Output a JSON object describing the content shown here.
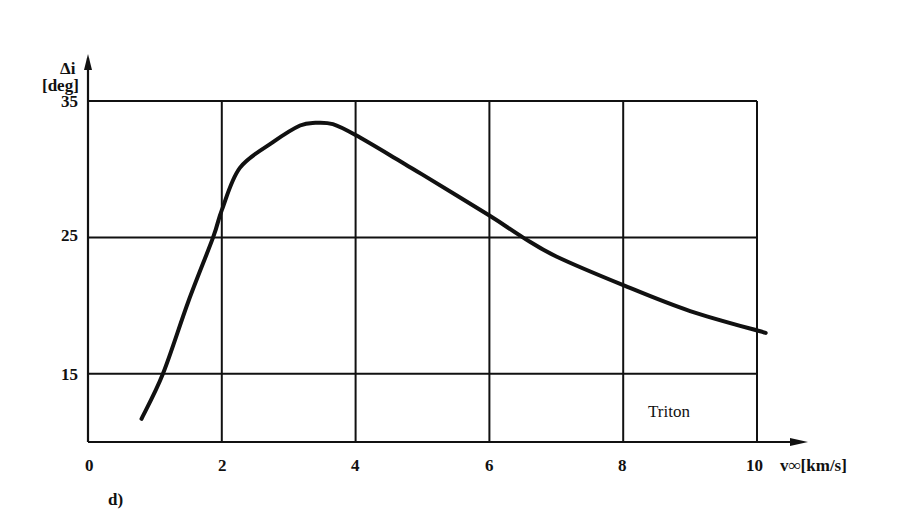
{
  "chart_data": {
    "type": "line",
    "title": "",
    "panel_label": "d)",
    "xlabel": "v∞[km/s]",
    "ylabel_symbol": "Δi",
    "ylabel_unit": "[deg]",
    "annotation": "Triton",
    "xlim": [
      0,
      10
    ],
    "ylim": [
      10,
      35
    ],
    "x_ticks": [
      0,
      2,
      4,
      6,
      8,
      10
    ],
    "y_ticks": [
      15,
      25,
      35
    ],
    "grid": true,
    "legend": "none",
    "series": [
      {
        "name": "Triton",
        "x": [
          0.8,
          1.12,
          1.5,
          1.87,
          2.0,
          2.27,
          2.77,
          3.17,
          3.4,
          3.66,
          4.0,
          4.66,
          5.0,
          6.0,
          6.5,
          7.0,
          8.0,
          9.0,
          10.13
        ],
        "y": [
          11.7,
          15.0,
          20.3,
          25.0,
          27.0,
          30.1,
          32.0,
          33.2,
          33.4,
          33.3,
          32.5,
          30.6,
          29.6,
          26.6,
          25.0,
          23.6,
          21.5,
          19.6,
          18.0
        ]
      }
    ]
  },
  "labels": {
    "ylabel_symbol": "Δi",
    "ylabel_unit": "[deg]",
    "y35": "35",
    "y25": "25",
    "y15": "15",
    "x0": "0",
    "x2": "2",
    "x4": "4",
    "x6": "6",
    "x8": "8",
    "x10": "10",
    "xlabel": "v∞[km/s]",
    "annotation": "Triton",
    "panel": "d)"
  },
  "colors": {
    "ink": "#111111",
    "background": "#ffffff"
  }
}
